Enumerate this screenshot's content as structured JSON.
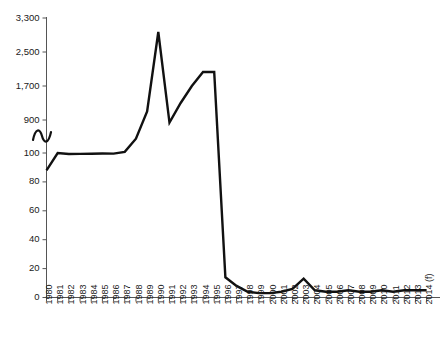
{
  "chart_data": {
    "type": "line",
    "title": "",
    "subtitle": "",
    "xlabel": "",
    "ylabel": "",
    "grid": false,
    "legend": false,
    "legend_position": "none",
    "axis_break": {
      "present": true,
      "between": [
        100,
        900
      ],
      "note": "y-axis broken between 100 and 900"
    },
    "y_ticks_lower": [
      0,
      20,
      40,
      60,
      80,
      100
    ],
    "y_ticks_upper": [
      900,
      1700,
      2500,
      3300
    ],
    "y_tick_labels": [
      "0",
      "20",
      "40",
      "60",
      "80",
      "100",
      "900",
      "1,700",
      "2,500",
      "3,300"
    ],
    "ylim_lower": [
      0,
      100
    ],
    "ylim_upper": [
      100,
      3300
    ],
    "categories": [
      "1980",
      "1981",
      "1982",
      "1983",
      "1984",
      "1985",
      "1986",
      "1987",
      "1988",
      "1989",
      "1990",
      "1991",
      "1992",
      "1993",
      "1994",
      "1995",
      "1996",
      "1997",
      "1998",
      "1999",
      "2000",
      "2001",
      "2002",
      "2003",
      "2004",
      "2005",
      "2006",
      "2007",
      "2008",
      "2009",
      "2010",
      "2011",
      "2012",
      "2013",
      "2014 (f)"
    ],
    "x_tick_labels": [
      "1980",
      "1981",
      "1982",
      "1983",
      "1984",
      "1985",
      "1986",
      "1987",
      "1988",
      "1989",
      "1990",
      "1991",
      "1992",
      "1993",
      "1994",
      "1995",
      "1996",
      "1997",
      "1998",
      "1999",
      "2000",
      "2001",
      "2002",
      "2003",
      "2004",
      "2005",
      "2006",
      "2007",
      "2008",
      "2009",
      "2010",
      "2011",
      "2012",
      "2013",
      "2014 (f)"
    ],
    "series": [
      {
        "name": "",
        "color": "#111111",
        "values": [
          88,
          100,
          101,
          103,
          105,
          112,
          108,
          150,
          460,
          1100,
          2970,
          840,
          1300,
          1700,
          2030,
          2030,
          14,
          8,
          4,
          3,
          3,
          4,
          6,
          13,
          5,
          4,
          4,
          5,
          4,
          4,
          5,
          4,
          5,
          5,
          5
        ]
      }
    ]
  }
}
